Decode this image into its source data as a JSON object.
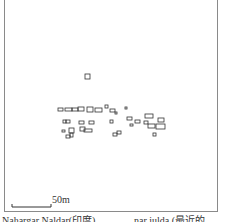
{
  "figure": {
    "scale_bar": {
      "label": "50m",
      "length_px": 39
    },
    "caption_left": "Nahargar Naldar(印度)",
    "caption_right": "nar iulda (最近的"
  },
  "buildings": [
    {
      "x": 85,
      "y": 74,
      "w": 5,
      "h": 5
    },
    {
      "x": 58,
      "y": 108,
      "w": 5,
      "h": 3
    },
    {
      "x": 65,
      "y": 108,
      "w": 7,
      "h": 3
    },
    {
      "x": 72,
      "y": 108,
      "w": 6,
      "h": 3
    },
    {
      "x": 78,
      "y": 107,
      "w": 6,
      "h": 4
    },
    {
      "x": 87,
      "y": 107,
      "w": 6,
      "h": 5
    },
    {
      "x": 95,
      "y": 108,
      "w": 7,
      "h": 4
    },
    {
      "x": 105,
      "y": 105,
      "w": 3,
      "h": 3
    },
    {
      "x": 110,
      "y": 109,
      "w": 5,
      "h": 3
    },
    {
      "x": 115,
      "y": 112,
      "w": 2,
      "h": 2
    },
    {
      "x": 125,
      "y": 107,
      "w": 2,
      "h": 2
    },
    {
      "x": 63,
      "y": 120,
      "w": 3,
      "h": 3
    },
    {
      "x": 66,
      "y": 120,
      "w": 4,
      "h": 3
    },
    {
      "x": 79,
      "y": 121,
      "w": 5,
      "h": 3
    },
    {
      "x": 89,
      "y": 121,
      "w": 5,
      "h": 3
    },
    {
      "x": 110,
      "y": 120,
      "w": 3,
      "h": 3
    },
    {
      "x": 127,
      "y": 117,
      "w": 5,
      "h": 3
    },
    {
      "x": 130,
      "y": 124,
      "w": 3,
      "h": 2
    },
    {
      "x": 135,
      "y": 120,
      "w": 5,
      "h": 3
    },
    {
      "x": 145,
      "y": 114,
      "w": 8,
      "h": 4
    },
    {
      "x": 158,
      "y": 118,
      "w": 6,
      "h": 4
    },
    {
      "x": 144,
      "y": 121,
      "w": 4,
      "h": 3
    },
    {
      "x": 148,
      "y": 124,
      "w": 7,
      "h": 4
    },
    {
      "x": 156,
      "y": 124,
      "w": 9,
      "h": 5
    },
    {
      "x": 62,
      "y": 130,
      "w": 3,
      "h": 2
    },
    {
      "x": 69,
      "y": 128,
      "w": 5,
      "h": 5
    },
    {
      "x": 80,
      "y": 127,
      "w": 5,
      "h": 4
    },
    {
      "x": 84,
      "y": 129,
      "w": 8,
      "h": 3
    },
    {
      "x": 113,
      "y": 133,
      "w": 4,
      "h": 3
    },
    {
      "x": 117,
      "y": 131,
      "w": 4,
      "h": 3
    },
    {
      "x": 153,
      "y": 133,
      "w": 3,
      "h": 3
    },
    {
      "x": 66,
      "y": 135,
      "w": 4,
      "h": 3
    },
    {
      "x": 70,
      "y": 133,
      "w": 3,
      "h": 4
    }
  ]
}
